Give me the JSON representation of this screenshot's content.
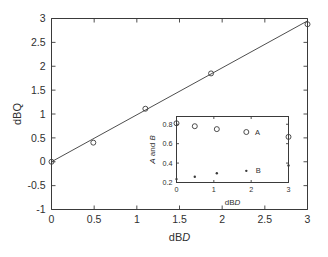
{
  "figure": {
    "background": "#ffffff",
    "ink_color": "#3a3a3a"
  },
  "chart_data": [
    {
      "id": "main",
      "type": "scatter",
      "title": "",
      "xlabel": "dBD",
      "xlabel_parts": [
        {
          "text": "dB",
          "italic": false
        },
        {
          "text": "D",
          "italic": true
        }
      ],
      "ylabel": "dBQ",
      "ylabel_parts": [
        {
          "text": "dBQ",
          "italic": false
        }
      ],
      "xlim": [
        0,
        3
      ],
      "ylim": [
        -1,
        3
      ],
      "xticks": [
        0,
        0.5,
        1,
        1.5,
        2,
        2.5,
        3
      ],
      "xticklabels": [
        "0",
        "0.5",
        "1",
        "1.5",
        "2",
        "2.5",
        "3"
      ],
      "yticks": [
        -1,
        -0.5,
        0,
        0.5,
        1,
        1.5,
        2,
        2.5,
        3
      ],
      "yticklabels": [
        "-1",
        "-0.5",
        "0",
        "0.5",
        "1",
        "1.5",
        "2",
        "2.5",
        "3"
      ],
      "grid": false,
      "legend": "none",
      "series": [
        {
          "name": "measured",
          "marker": "open-circle",
          "x": [
            0,
            0.49,
            1.1,
            1.87,
            3.0
          ],
          "y": [
            0.0,
            0.4,
            1.11,
            1.85,
            2.88
          ]
        },
        {
          "name": "fit",
          "marker": "line",
          "x": [
            0,
            3.0
          ],
          "y": [
            0.0,
            2.95
          ]
        }
      ]
    },
    {
      "id": "inset",
      "type": "scatter",
      "title": "",
      "xlabel": "dBD",
      "xlabel_parts": [
        {
          "text": "dB",
          "italic": false
        },
        {
          "text": "D",
          "italic": true
        }
      ],
      "ylabel": "A and B",
      "ylabel_parts": [
        {
          "text": "A",
          "italic": true
        },
        {
          "text": " and ",
          "italic": false
        },
        {
          "text": "B",
          "italic": true
        }
      ],
      "xlim": [
        0,
        3
      ],
      "ylim": [
        0.2,
        0.88
      ],
      "xticks": [
        0,
        1,
        2,
        3
      ],
      "xticklabels": [
        "0",
        "1",
        "2",
        "3"
      ],
      "yticks": [
        0.2,
        0.4,
        0.6,
        0.8
      ],
      "yticklabels": [
        "0.2",
        "0.4",
        "0.6",
        "0.8"
      ],
      "grid": false,
      "legend": "inline-annotations",
      "annotations": [
        {
          "label": "A",
          "x": 2.1,
          "y": 0.72
        },
        {
          "label": "B",
          "x": 2.12,
          "y": 0.325
        }
      ],
      "series": [
        {
          "name": "A",
          "marker": "open-circle",
          "x": [
            0,
            0.49,
            1.08,
            1.87,
            3.0
          ],
          "y": [
            0.81,
            0.78,
            0.75,
            0.72,
            0.67
          ]
        },
        {
          "name": "B",
          "marker": "dot",
          "x": [
            0,
            0.49,
            1.08,
            1.87,
            3.0
          ],
          "y": [
            0.235,
            0.26,
            0.295,
            0.32,
            0.375
          ]
        }
      ]
    }
  ]
}
